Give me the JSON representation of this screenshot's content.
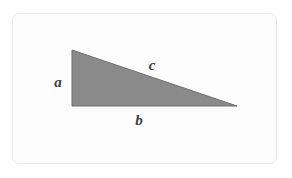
{
  "figure": {
    "name": "right-triangle-labeled-sides",
    "background_color": "#ffffff",
    "card": {
      "fill_color": "#fcfcfc",
      "border_color": "#e9e9e9",
      "x": 12,
      "y": 13,
      "width": 265,
      "height": 151,
      "corner_radius": 7
    },
    "shape": {
      "type": "triangle",
      "fill_color": "#8a8a8a",
      "stroke_color": "#6f6f6f",
      "stroke_width": 1,
      "vertices": [
        {
          "name": "apex-top-left",
          "x": 72,
          "y": 50
        },
        {
          "name": "right-angle-bottom-left",
          "x": 72,
          "y": 106
        },
        {
          "name": "vertex-bottom-right",
          "x": 237,
          "y": 106
        }
      ]
    },
    "labels": [
      {
        "id": "a",
        "text": "a",
        "side": "vertical-leg",
        "position": {
          "x": 58,
          "y": 82
        },
        "color": "#3b3b3b"
      },
      {
        "id": "b",
        "text": "b",
        "side": "horizontal-leg",
        "position": {
          "x": 139,
          "y": 120
        },
        "color": "#3b3b3b"
      },
      {
        "id": "c",
        "text": "c",
        "side": "hypotenuse",
        "position": {
          "x": 152,
          "y": 65
        },
        "color": "#3b3b3b"
      }
    ]
  }
}
